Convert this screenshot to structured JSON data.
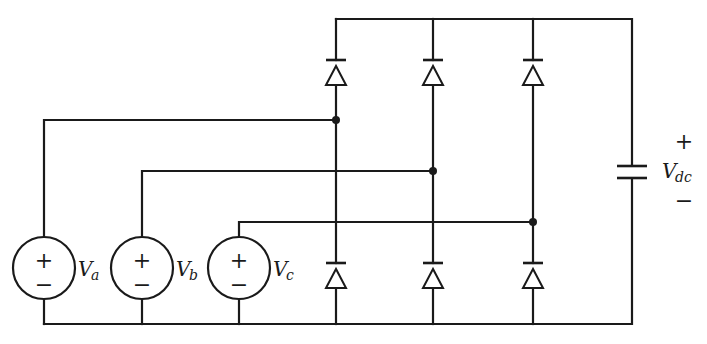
{
  "diagram": {
    "sources": [
      {
        "id": "a",
        "label": "V",
        "subscript": "a",
        "plus": "+",
        "minus": "−"
      },
      {
        "id": "b",
        "label": "V",
        "subscript": "b",
        "plus": "+",
        "minus": "−"
      },
      {
        "id": "c",
        "label": "V",
        "subscript": "c",
        "plus": "+",
        "minus": "−"
      }
    ],
    "diodes": {
      "upper": [
        "D1",
        "D3",
        "D5"
      ],
      "lower": [
        "D4",
        "D6",
        "D2"
      ],
      "direction": "anode-bottom cathode-top"
    },
    "capacitor": {
      "label": "V",
      "subscript": "dc",
      "plus": "+",
      "minus": "−"
    },
    "colors": {
      "stroke": "#1a1a1a",
      "background": "#ffffff"
    }
  }
}
